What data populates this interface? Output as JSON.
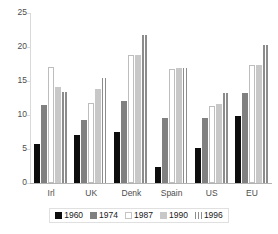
{
  "chart_data": {
    "type": "bar",
    "title": "",
    "xlabel": "",
    "ylabel": "",
    "ylim": [
      0,
      25
    ],
    "yticks": [
      0,
      5,
      10,
      15,
      20,
      25
    ],
    "grid": false,
    "legend_position": "bottom",
    "categories": [
      "Irl",
      "UK",
      "Denk",
      "Spain",
      "US",
      "EU"
    ],
    "series": [
      {
        "name": "1960",
        "values": [
          5.8,
          7.0,
          7.5,
          2.4,
          5.2,
          9.9
        ]
      },
      {
        "name": "1974",
        "values": [
          11.5,
          9.2,
          12.1,
          9.6,
          9.6,
          13.2
        ]
      },
      {
        "name": "1987",
        "values": [
          17.0,
          11.7,
          18.8,
          16.7,
          11.3,
          17.4
        ]
      },
      {
        "name": "1990",
        "values": [
          14.1,
          13.8,
          18.8,
          16.9,
          11.6,
          17.4
        ]
      },
      {
        "name": "1996",
        "values": [
          13.4,
          15.5,
          21.8,
          16.9,
          13.2,
          20.3
        ]
      }
    ]
  },
  "legend": {
    "items": [
      {
        "label": "1960"
      },
      {
        "label": "1974"
      },
      {
        "label": "1987"
      },
      {
        "label": "1990"
      },
      {
        "label": "1996"
      }
    ]
  },
  "colors": {
    "s1960": "#0d0d0d",
    "s1974": "#808080",
    "s1987": "#ffffff",
    "s1990": "#c8c8c8",
    "s1996": "#8c8c8c",
    "axis": "#b3b3b3",
    "text": "#4d4d4d"
  }
}
